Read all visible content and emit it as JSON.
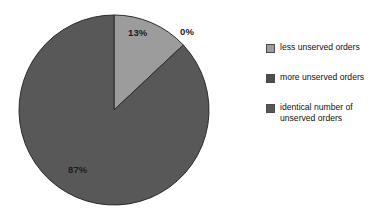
{
  "chart_data": {
    "type": "pie",
    "title": "",
    "categories": [
      "less unserved orders",
      "more unserved orders",
      "identical number of unserved orders"
    ],
    "values": [
      13,
      0,
      87
    ],
    "value_labels": [
      "13%",
      "0%",
      "87%"
    ],
    "units": "percent",
    "start_angle_deg": 0,
    "direction": "clockwise",
    "legend_position": "right",
    "grid": false,
    "colors": [
      "#9c9c9c",
      "#4e4e4e",
      "#585858"
    ],
    "slices": [
      {
        "label": "less unserved orders",
        "value": 13,
        "value_label": "13%",
        "color": "#9c9c9c",
        "start_deg": 0,
        "end_deg": 46.8
      },
      {
        "label": "more unserved orders",
        "value": 0,
        "value_label": "0%",
        "color": "#4e4e4e",
        "start_deg": 46.8,
        "end_deg": 46.8
      },
      {
        "label": "identical number of unserved orders",
        "value": 87,
        "value_label": "87%",
        "color": "#585858",
        "start_deg": 46.8,
        "end_deg": 360
      }
    ]
  },
  "pie": {
    "center_x": 114,
    "center_y": 110,
    "radius": 95,
    "outline_color": "#2b2b2b"
  },
  "legend": {
    "items": [
      {
        "label": "less unserved orders",
        "color": "#9c9c9c"
      },
      {
        "label": "more unserved orders",
        "color": "#4e4e4e"
      },
      {
        "label": "identical number of\nunserved orders",
        "color": "#585858"
      }
    ]
  }
}
